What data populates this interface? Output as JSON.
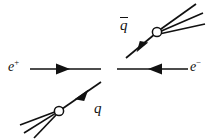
{
  "figure": {
    "kind": "feynman-diagram",
    "background_color": "#ffffff",
    "line_color": "#111111",
    "vertex_fill_color": "#ffffff"
  },
  "labels": {
    "electron_positron": {
      "base": "e",
      "charge": "+",
      "text": "e+"
    },
    "electron": {
      "base": "e",
      "charge": "−",
      "text": "e−"
    },
    "quark": {
      "base": "q",
      "text": "q"
    },
    "antiquark": {
      "base": "q",
      "text": "q̅",
      "overbar": true
    }
  },
  "elements": {
    "positron_line": "positron-incoming-line",
    "electron_line": "electron-incoming-line",
    "antiquark_line": "antiquark-outgoing-line",
    "quark_line": "quark-outgoing-line",
    "antiquark_blob": "antiquark-hadronization-blob",
    "quark_blob": "quark-hadronization-blob",
    "antiquark_jet": "antiquark-jet-prongs",
    "quark_jet": "quark-jet-prongs"
  },
  "counts": {
    "antiquark_jet_prongs": 3,
    "quark_jet_prongs": 3,
    "vertices": 2,
    "arrowheads": 4
  },
  "geometry": {
    "positron_line": {
      "x1": 30,
      "y1": 69,
      "x2": 101,
      "y2": 69
    },
    "electron_line": {
      "x1": 117,
      "y1": 69,
      "x2": 188,
      "y2": 69
    },
    "antiquark_line": {
      "x1": 126,
      "y1": 58,
      "x2": 155,
      "y2": 34
    },
    "quark_line": {
      "x1": 101,
      "y1": 82,
      "x2": 62,
      "y2": 109
    },
    "antiquark_blob": {
      "cx": 157,
      "cy": 32,
      "r": 4.6
    },
    "quark_blob": {
      "cx": 59,
      "cy": 111,
      "r": 4.6
    },
    "antiquark_prongs": [
      {
        "x2": 196,
        "y2": 4
      },
      {
        "x2": 203,
        "y2": 13
      },
      {
        "x2": 205,
        "y2": 24
      }
    ],
    "quark_prongs": [
      {
        "x2": 20,
        "y2": 125
      },
      {
        "x2": 24,
        "y2": 133
      },
      {
        "x2": 34,
        "y2": 138
      }
    ]
  }
}
